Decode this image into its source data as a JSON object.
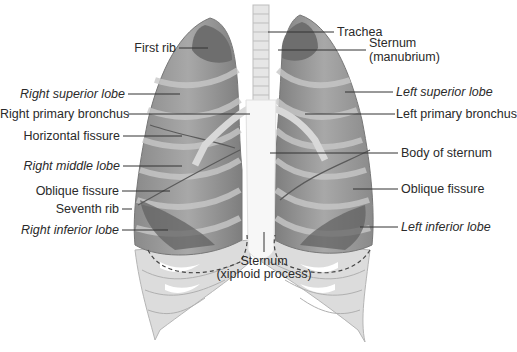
{
  "diagram": {
    "colors": {
      "background": "#ffffff",
      "lung_dark": "#6e6e6e",
      "lung_mid": "#9a9a9a",
      "lung_light": "#c4c4c4",
      "bone": "#e2e2e2",
      "sternum": "#f4f4f4",
      "leader_line": "#333333",
      "text": "#2a2a2a"
    },
    "labels_left": [
      {
        "id": "first-rib",
        "text": "First rib",
        "italic": false
      },
      {
        "id": "right-superior-lobe",
        "text": "Right superior lobe",
        "italic": true
      },
      {
        "id": "right-primary-bronchus",
        "text": "Right primary bronchus",
        "italic": false
      },
      {
        "id": "horizontal-fissure",
        "text": "Horizontal fissure",
        "italic": false
      },
      {
        "id": "right-middle-lobe",
        "text": "Right middle lobe",
        "italic": true
      },
      {
        "id": "oblique-fissure-right",
        "text": "Oblique fissure",
        "italic": false
      },
      {
        "id": "seventh-rib",
        "text": "Seventh rib",
        "italic": false
      },
      {
        "id": "right-inferior-lobe",
        "text": "Right inferior lobe",
        "italic": true
      }
    ],
    "labels_right": [
      {
        "id": "trachea",
        "text": "Trachea",
        "italic": false
      },
      {
        "id": "sternum-manubrium",
        "text": "Sternum",
        "text2": "(manubrium)",
        "italic": false
      },
      {
        "id": "left-superior-lobe",
        "text": "Left superior lobe",
        "italic": true
      },
      {
        "id": "left-primary-bronchus",
        "text": "Left primary bronchus",
        "italic": false
      },
      {
        "id": "body-of-sternum",
        "text": "Body of sternum",
        "italic": false
      },
      {
        "id": "oblique-fissure-left",
        "text": "Oblique fissure",
        "italic": false
      },
      {
        "id": "left-inferior-lobe",
        "text": "Left inferior lobe",
        "italic": true
      }
    ],
    "label_bottom": {
      "id": "sternum-xiphoid",
      "text": "Sternum",
      "text2": "(xiphoid process)",
      "italic": false
    }
  }
}
